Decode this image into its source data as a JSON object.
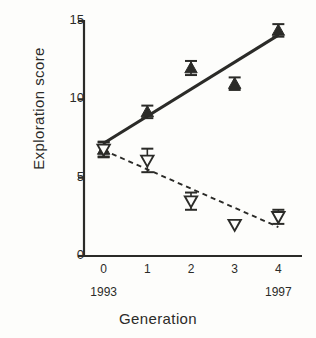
{
  "chart_data": {
    "type": "scatter",
    "title": "",
    "xlabel": "Generation",
    "ylabel": "Exploration score",
    "xlim": [
      -0.45,
      4.45
    ],
    "ylim": [
      0,
      15
    ],
    "xticks": [
      "0",
      "1",
      "2",
      "3",
      "4"
    ],
    "xtick_values": [
      0,
      1,
      2,
      3,
      4
    ],
    "yticks": [
      "0",
      "5",
      "10",
      "15"
    ],
    "ytick_values": [
      0,
      5,
      10,
      15
    ],
    "grid": false,
    "legend": "none",
    "secondary_xticks": [
      {
        "value": 0,
        "label": "1993"
      },
      {
        "value": 4,
        "label": "1997"
      }
    ],
    "x": [
      0,
      1,
      2,
      3,
      4
    ],
    "series": [
      {
        "name": "filled-triangle-up",
        "marker": "triangle-up-filled",
        "line": "solid",
        "values": [
          6.8,
          9.2,
          12.0,
          11.0,
          14.4
        ],
        "errors": [
          0.45,
          0.4,
          0.45,
          0.4,
          0.4
        ],
        "fit_line": {
          "x0": 0,
          "y0": 7.2,
          "x1": 4,
          "y1": 14.1
        }
      },
      {
        "name": "open-triangle-down",
        "marker": "triangle-down-open",
        "line": "dashed",
        "values": [
          6.8,
          6.1,
          3.5,
          2.0,
          2.5
        ],
        "errors": [
          0.5,
          0.75,
          0.55,
          0.0,
          0.45
        ],
        "fit_line": {
          "x0": 0,
          "y0": 6.75,
          "x1": 4,
          "y1": 1.85
        }
      }
    ]
  },
  "axis": {
    "ylabel": "Exploration score",
    "xlabel": "Generation"
  }
}
